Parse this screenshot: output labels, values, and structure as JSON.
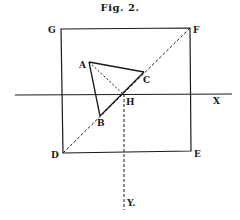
{
  "figure": {
    "title": "Fig. 2.",
    "labels": {
      "G": "G",
      "F": "F",
      "D": "D",
      "E": "E",
      "A": "A",
      "B": "B",
      "C": "C",
      "H": "H",
      "X": "X",
      "Y": "Y."
    },
    "colors": {
      "ink": "#1a1a1a",
      "background": "#ffffff"
    }
  }
}
